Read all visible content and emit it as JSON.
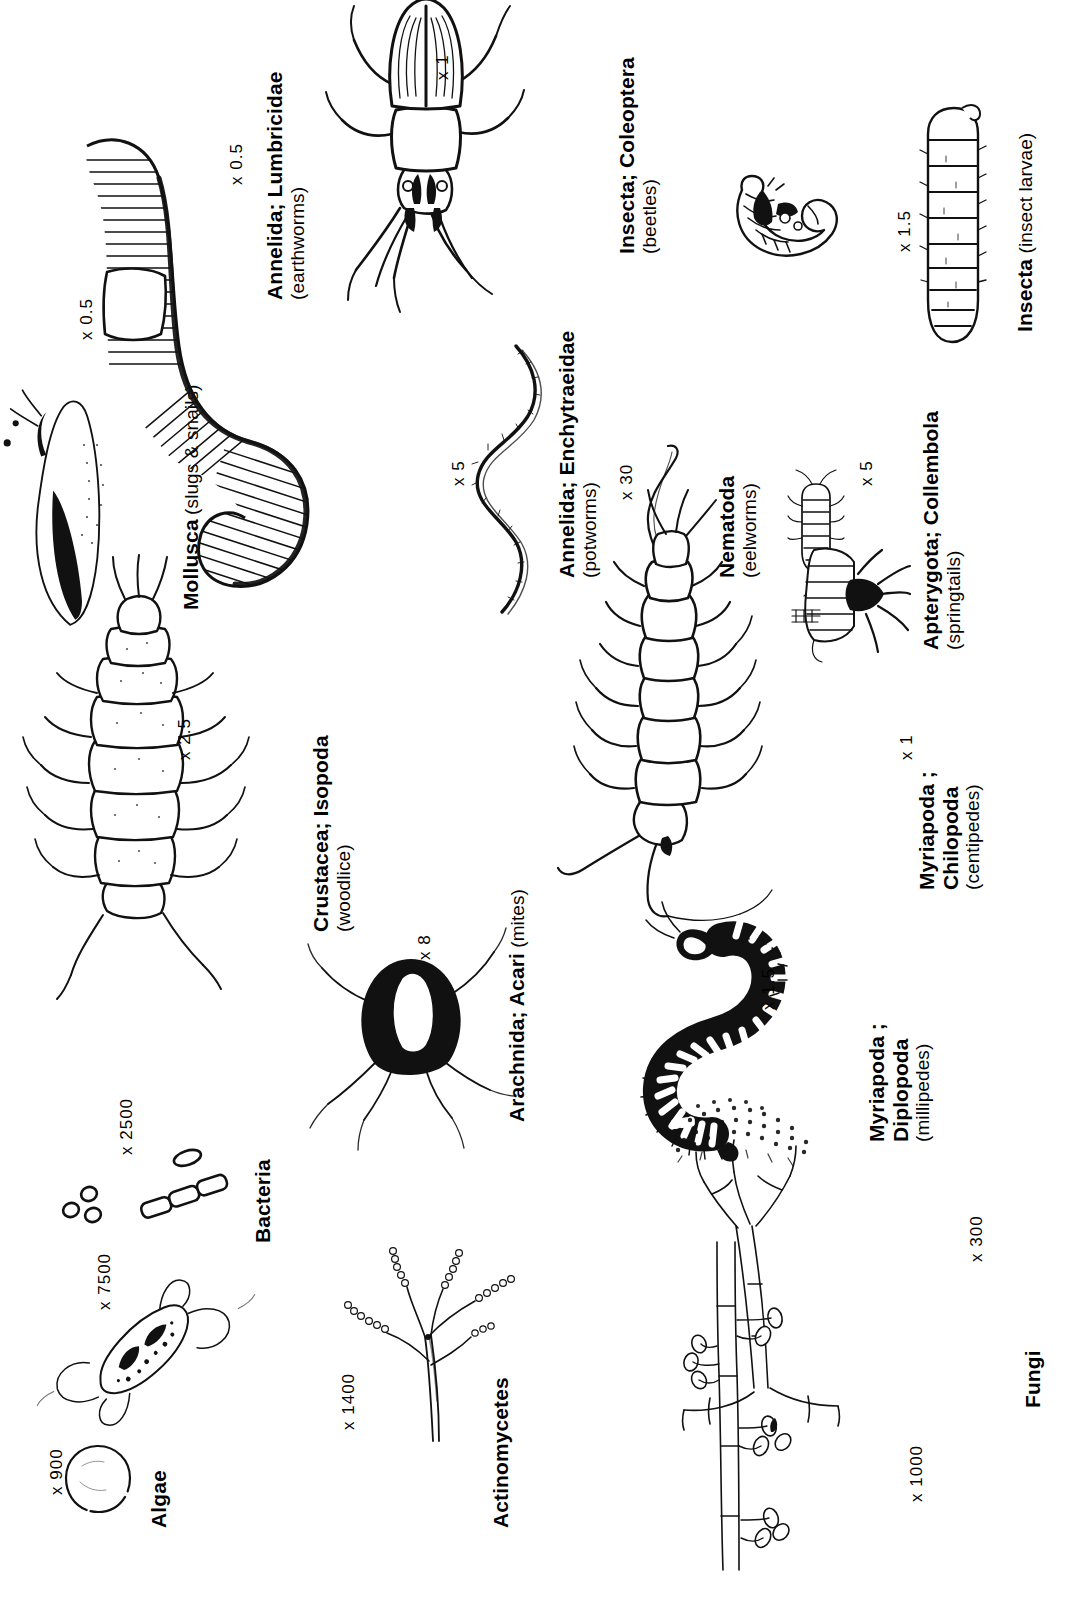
{
  "plate": {
    "title": "Soil organisms",
    "orientation": "rotated-90-ccw",
    "background_color": "#ffffff",
    "ink_color": "#111111"
  },
  "organisms": [
    {
      "key": "mollusca",
      "name": "Mollusca",
      "common": "(slugs & snails)",
      "magnification": "x 0.5"
    },
    {
      "key": "annelida_lumbricidae",
      "name": "Annelida; Lumbricidae",
      "common": "(earthworms)",
      "magnification": "x 0.5"
    },
    {
      "key": "insecta_coleoptera",
      "name": "Insecta; Coleoptera",
      "common": "(beetles)",
      "magnification": "x 1"
    },
    {
      "key": "insecta_larvae",
      "name": "Insecta",
      "common": "(insect larvae)",
      "magnification": "x 1.5"
    },
    {
      "key": "annelida_enchytraeidae",
      "name": "Annelida; Enchytraeidae",
      "common": "(potworms)",
      "magnification": "x 5"
    },
    {
      "key": "nematoda",
      "name": "Nematoda",
      "common": "(eelworms)",
      "magnification": "x 30"
    },
    {
      "key": "apterygota_collembola",
      "name": "Apterygota; Collembola",
      "common": "(springtails)",
      "magnification": "x 5"
    },
    {
      "key": "crustacea_isopoda",
      "name": "Crustacea; Isopoda",
      "common": "(woodlice)",
      "magnification": "x 2.5"
    },
    {
      "key": "myriapoda_chilopoda",
      "name": "Myriapoda ;",
      "name_line2": "Chilopoda",
      "common": "(centipedes)",
      "magnification": "x 1"
    },
    {
      "key": "arachnida_acari",
      "name": "Arachnida; Acari",
      "common": "(mites)",
      "magnification": "x 8"
    },
    {
      "key": "myriapoda_diplopoda",
      "name": "Myriapoda ;",
      "name_line2": "Diplopoda",
      "common": "(millipedes)",
      "magnification": "x 1.5"
    },
    {
      "key": "algae",
      "name": "Algae",
      "common": "",
      "magnification": "x 900"
    },
    {
      "key": "bacteria",
      "name": "Bacteria",
      "common": "",
      "magnification": "x 2500",
      "magnification_2": "x 7500"
    },
    {
      "key": "actinomycetes",
      "name": "Actinomycetes",
      "common": "",
      "magnification": "x 1400"
    },
    {
      "key": "fungi",
      "name": "Fungi",
      "common": "",
      "magnification": "x 300",
      "magnification_2": "x 1000"
    }
  ]
}
